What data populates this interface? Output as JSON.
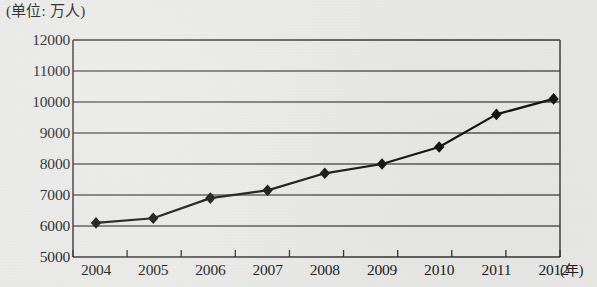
{
  "chart_data": {
    "type": "line",
    "title": "(单位: 万人)",
    "xlabel": "(年)",
    "ylabel": "",
    "categories": [
      "2004",
      "2005",
      "2006",
      "2007",
      "2008",
      "2009",
      "2010",
      "2011",
      "2012"
    ],
    "values": [
      6100,
      6250,
      6900,
      7150,
      7700,
      8000,
      8550,
      9600,
      10100
    ],
    "series": [
      {
        "name": "",
        "values": [
          6100,
          6250,
          6900,
          7150,
          7700,
          8000,
          8550,
          9600,
          10100
        ]
      }
    ],
    "ylim": [
      5000,
      12000
    ],
    "y_ticks": [
      12000,
      11000,
      10000,
      9000,
      8000,
      7000,
      6000,
      5000
    ],
    "y_tick_labels": [
      "12000",
      "11000",
      "10000",
      "9000",
      "8000",
      "7000",
      "6000",
      "5000"
    ],
    "x_tick_labels": [
      "2004",
      "2005",
      "2006",
      "2007",
      "2008",
      "2009",
      "2010",
      "2011",
      "2012"
    ],
    "grid": true,
    "legend": false,
    "legend_position": "none",
    "marker": "diamond",
    "line_color": "#1a1a1a",
    "marker_color": "#111111",
    "grid_color": "#555555",
    "axis_color": "#333333",
    "background_color": "#e9e9e7"
  },
  "layout": {
    "plot_left": 73,
    "plot_right": 560,
    "plot_top": 40,
    "plot_bottom": 257,
    "point_start_x": 96,
    "point_step_x": 57.2
  }
}
